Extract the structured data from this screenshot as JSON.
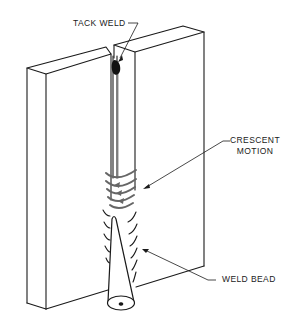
{
  "diagram": {
    "type": "technical-illustration",
    "labels": {
      "tack_weld": "TACK WELD",
      "crescent_line1": "CRESCENT",
      "crescent_line2": "MOTION",
      "weld_bead": "WELD BEAD"
    },
    "colors": {
      "background": "#ffffff",
      "line": "#1a1a1a",
      "weld_fill": "#111111",
      "motion_arrows": "#666666"
    }
  }
}
